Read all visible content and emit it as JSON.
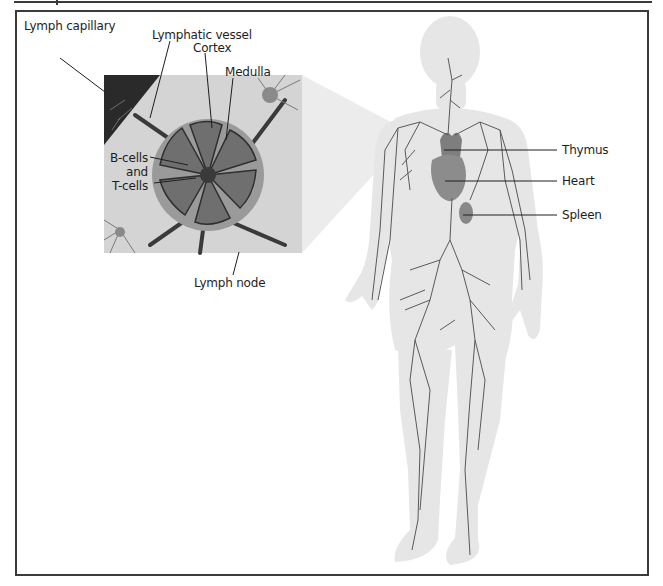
{
  "figure": {
    "inset_title": "Lymph node detail",
    "inset_labels": {
      "lymph_capillary": "Lymph capillary",
      "lymphatic_vessel": "Lymphatic vessel",
      "cortex": "Cortex",
      "medulla": "Medulla",
      "b_cells": "B-cells",
      "and": "and",
      "t_cells": "T-cells",
      "lymph_node": "Lymph node"
    },
    "organ_labels": {
      "thymus": "Thymus",
      "heart": "Heart",
      "spleen": "Spleen"
    },
    "colors": {
      "body": "#e6e6e6",
      "vessel": "#5a5a5a",
      "organ": "#8c8c8c",
      "node": "#9a9a9a",
      "inset_bg": "#d4d4d4",
      "capillary_bg": "#2a2a2a",
      "frame": "#3b3b3b"
    }
  }
}
